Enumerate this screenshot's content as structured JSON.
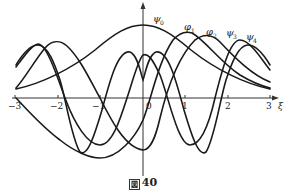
{
  "figure": {
    "caption_prefix": "図",
    "caption_number": "40",
    "axis": {
      "x_label": "ξ",
      "ticks": [
        {
          "value": -3,
          "label": "−3"
        },
        {
          "value": -2,
          "label": "−2"
        },
        {
          "value": -1,
          "label": "−1"
        },
        {
          "value": 0,
          "label": "0"
        },
        {
          "value": 1,
          "label": "1"
        },
        {
          "value": 2,
          "label": "2"
        },
        {
          "value": 3,
          "label": "3"
        }
      ]
    },
    "curves": [
      {
        "name": "phi0",
        "label": "ψ0",
        "sym": "ψ",
        "sub": "0"
      },
      {
        "name": "phi1",
        "label": "φ1",
        "sym": "φ",
        "sub": "1"
      },
      {
        "name": "phi2",
        "label": "φ2",
        "sym": "φ",
        "sub": "2"
      },
      {
        "name": "phi3",
        "label": "ψ3",
        "sym": "ψ",
        "sub": "3"
      },
      {
        "name": "phi4",
        "label": "ψ4",
        "sym": "ψ",
        "sub": "4"
      }
    ]
  }
}
